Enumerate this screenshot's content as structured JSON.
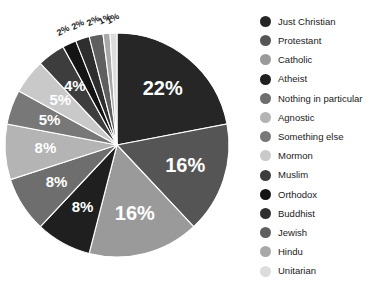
{
  "chart_data": {
    "type": "pie",
    "title": "",
    "subtitle": "",
    "xlabel": "",
    "ylabel": "",
    "legend_position": "right",
    "grid": false,
    "value_suffix": "%",
    "categories": [
      "Just Christian",
      "Protestant",
      "Catholic",
      "Atheist",
      "Nothing in particular",
      "Agnostic",
      "Something else",
      "Mormon",
      "Muslim",
      "Orthodox",
      "Buddhist",
      "Jewish",
      "Hindu",
      "Unitarian"
    ],
    "values": [
      22,
      16,
      16,
      8,
      8,
      8,
      5,
      5,
      4,
      2,
      2,
      2,
      1,
      1
    ],
    "labels": [
      "22%",
      "16%",
      "16%",
      "8%",
      "8%",
      "8%",
      "5%",
      "5%",
      "4%",
      "2%",
      "2%",
      "2%",
      "1%",
      "1%"
    ],
    "colors": [
      "#262626",
      "#555555",
      "#9a9a9a",
      "#1f1f1f",
      "#6e6e6e",
      "#b4b4b4",
      "#787878",
      "#c9c9c9",
      "#3d3d3d",
      "#141414",
      "#2e2e2e",
      "#5f5f5f",
      "#a8a8a8",
      "#dcdcdc"
    ],
    "start_angle_deg": 0,
    "direction": "clockwise"
  },
  "legend": {
    "items": [
      {
        "label": "Just Christian",
        "color": "#262626"
      },
      {
        "label": "Protestant",
        "color": "#555555"
      },
      {
        "label": "Catholic",
        "color": "#9a9a9a"
      },
      {
        "label": "Atheist",
        "color": "#1f1f1f"
      },
      {
        "label": "Nothing in particular",
        "color": "#6e6e6e"
      },
      {
        "label": "Agnostic",
        "color": "#b4b4b4"
      },
      {
        "label": "Something else",
        "color": "#787878"
      },
      {
        "label": "Mormon",
        "color": "#c9c9c9"
      },
      {
        "label": "Muslim",
        "color": "#3d3d3d"
      },
      {
        "label": "Orthodox",
        "color": "#141414"
      },
      {
        "label": "Buddhist",
        "color": "#2e2e2e"
      },
      {
        "label": "Jewish",
        "color": "#5f5f5f"
      },
      {
        "label": "Hindu",
        "color": "#a8a8a8"
      },
      {
        "label": "Unitarian",
        "color": "#dcdcdc"
      }
    ]
  }
}
